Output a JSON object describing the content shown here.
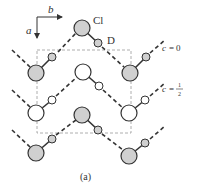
{
  "figure": {
    "caption": "(a)",
    "axes": {
      "horizontal_label": "b",
      "vertical_label": "a"
    },
    "atom_labels": {
      "chlorine": "Cl",
      "deuterium": "D"
    },
    "layer_labels": [
      {
        "var": "c",
        "eq": "=",
        "value": "0"
      },
      {
        "var": "c",
        "eq": "=",
        "value_num": "1",
        "value_den": "2"
      }
    ],
    "colors": {
      "line": "#333333",
      "gray_fill": "#d0d0d0",
      "white_fill": "#ffffff",
      "cell_dash": "#999999"
    },
    "molecules": [
      {
        "cl": [
          82,
          28
        ],
        "d": [
          98,
          43
        ],
        "shade": "gray",
        "hb_from": [
          72,
          42
        ],
        "hb_dir": "down-left"
      },
      {
        "cl": [
          36,
          73
        ],
        "d": [
          52,
          57
        ],
        "shade": "gray"
      },
      {
        "cl": [
          130,
          73
        ],
        "d": [
          146,
          57
        ],
        "shade": "gray"
      },
      {
        "cl": [
          83,
          72
        ],
        "d": [
          99,
          86
        ],
        "shade": "white"
      },
      {
        "cl": [
          36,
          113
        ],
        "d": [
          52,
          100
        ],
        "shade": "white"
      },
      {
        "cl": [
          129,
          113
        ],
        "d": [
          145,
          100
        ],
        "shade": "white"
      },
      {
        "cl": [
          82,
          115
        ],
        "d": [
          98,
          130
        ],
        "shade": "gray"
      },
      {
        "cl": [
          36,
          153
        ],
        "d": [
          52,
          139
        ],
        "shade": "gray"
      },
      {
        "cl": [
          129,
          156
        ],
        "d": [
          145,
          143
        ],
        "shade": "gray"
      }
    ]
  }
}
